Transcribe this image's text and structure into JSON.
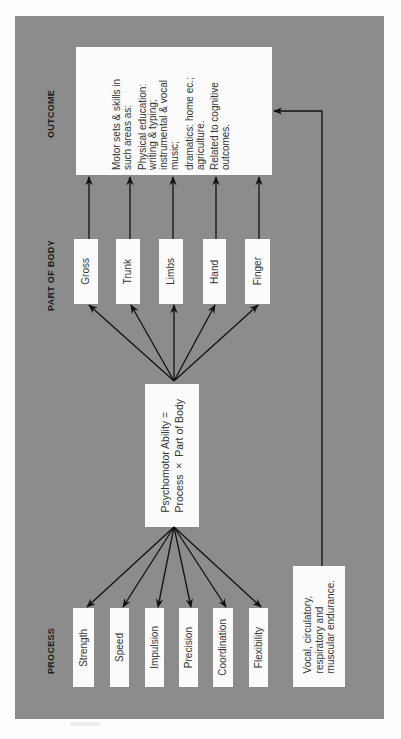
{
  "diagram": {
    "orientation": "rotated-90-ccw",
    "colors": {
      "panel": "#8c8c8c",
      "box": "#fbfbfb",
      "arrow": "#111111",
      "text": "#333333"
    },
    "columns": {
      "process": "PROCESS",
      "part_of_body": "PART OF BODY",
      "outcome": "OUTCOME"
    },
    "center": {
      "line1": "Psychomotor Ability =",
      "line2": "Process × Part of Body"
    },
    "process_items": [
      {
        "label": "Strength"
      },
      {
        "label": "Speed"
      },
      {
        "label": "Impulsion"
      },
      {
        "label": "Precision"
      },
      {
        "label": "Coordination"
      },
      {
        "label": "Flexibility"
      }
    ],
    "body_parts": [
      {
        "label": "Gross"
      },
      {
        "label": "Trunk"
      },
      {
        "label": "Limbs"
      },
      {
        "label": "Hand"
      },
      {
        "label": "Finger"
      }
    ],
    "endurance": {
      "line1": "Vocal, circulatory,",
      "line2": "respiratory and",
      "line3": "muscular endurance."
    },
    "outcome": {
      "p1_l1": "Motor sets & skills in",
      "p1_l2": "such areas as:",
      "p2_l1": "Physical education:",
      "p2_l2": "writing & typing;",
      "p2_l3": "instrumental & vocal",
      "p2_l4": "music;",
      "p3_l1": "dramatics: home ec.;",
      "p3_l2": "agriculture.",
      "p4_l1": "Related to cognitive",
      "p4_l2": "outcomes."
    },
    "edges": [
      "Psychomotor Ability -> Strength",
      "Psychomotor Ability -> Speed",
      "Psychomotor Ability -> Impulsion",
      "Psychomotor Ability -> Precision",
      "Psychomotor Ability -> Coordination",
      "Psychomotor Ability -> Flexibility",
      "Psychomotor Ability -> Gross",
      "Psychomotor Ability -> Trunk",
      "Psychomotor Ability -> Limbs",
      "Psychomotor Ability -> Hand",
      "Psychomotor Ability -> Finger",
      "Gross -> Outcome",
      "Trunk -> Outcome",
      "Limbs -> Outcome",
      "Hand -> Outcome",
      "Finger -> Outcome",
      "Vocal/circulatory endurance -> Outcome"
    ]
  }
}
